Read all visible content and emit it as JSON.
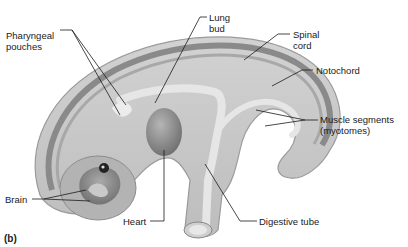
{
  "figure": {
    "panel_label": "(b)",
    "labels": {
      "pharyngeal_pouches": "Pharyngeal\npouches",
      "lung_bud": "Lung\nbud",
      "spinal_cord": "Spinal\ncord",
      "notochord": "Notochord",
      "muscle_segments": "Muscle segments\n(myotomes)",
      "brain": "Brain",
      "heart": "Heart",
      "digestive_tube": "Digestive tube"
    },
    "colors": {
      "body": "#c9c9c9",
      "body_outline": "#9a9a9a",
      "dorsal_band_dark": "#7d7d7d",
      "gut": "#e4e4e4",
      "organ": "#8f8f8f",
      "leader_line": "#1a1a1a"
    }
  }
}
